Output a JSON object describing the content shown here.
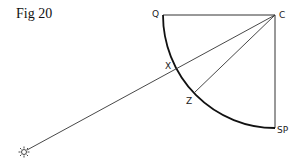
{
  "figure": {
    "title": "Fig 20",
    "labels": {
      "q": "Q",
      "c": "C",
      "x": "X",
      "z": "Z",
      "sp": "SP"
    },
    "icons": {
      "sun": "sun-icon"
    },
    "colors": {
      "line": "#333333",
      "arc": "#111111",
      "background": "#ffffff"
    }
  }
}
